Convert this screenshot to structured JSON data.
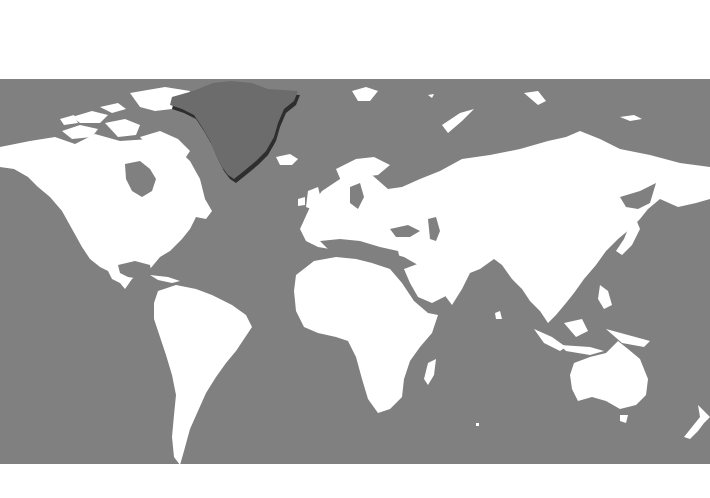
{
  "map": {
    "type": "world-choropleth",
    "projection": "mercator",
    "highlighted_region": "Greenland",
    "colors": {
      "background": "#ffffff",
      "ocean": "#808080",
      "land": "#ffffff",
      "highlight": "#6c6c6c",
      "highlight_shadow": "#2e2e2e"
    },
    "regions": [
      {
        "name": "North America",
        "highlighted": false
      },
      {
        "name": "Greenland",
        "highlighted": true
      },
      {
        "name": "South America",
        "highlighted": false
      },
      {
        "name": "Europe",
        "highlighted": false
      },
      {
        "name": "Africa",
        "highlighted": false
      },
      {
        "name": "Asia",
        "highlighted": false
      },
      {
        "name": "Australia",
        "highlighted": false
      },
      {
        "name": "New Zealand",
        "highlighted": false
      },
      {
        "name": "Madagascar",
        "highlighted": false
      },
      {
        "name": "Iceland",
        "highlighted": false
      }
    ]
  }
}
